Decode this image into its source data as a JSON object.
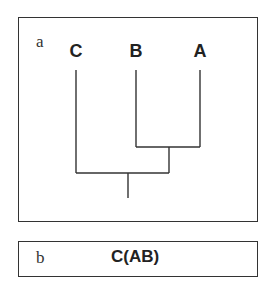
{
  "panel_a": {
    "label": "a",
    "taxa": [
      {
        "name": "C",
        "x": 76
      },
      {
        "name": "B",
        "x": 136
      },
      {
        "name": "A",
        "x": 200
      }
    ]
  },
  "panel_b": {
    "label": "b",
    "newick": "C(AB)"
  },
  "colors": {
    "line": "#333333",
    "text": "#222222",
    "background": "#ffffff"
  }
}
